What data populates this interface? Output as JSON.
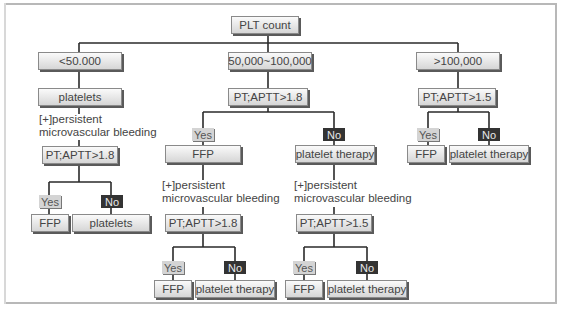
{
  "diagram": {
    "root": "PLT count",
    "branches": {
      "low": {
        "range": "<50.000",
        "action": "platelets",
        "note_line1": "[+]persistent",
        "note_line2": "microvascular bleeding",
        "test": "PT;APTT>1.8",
        "yes_label": "Yes",
        "no_label": "No",
        "yes_result": "FFP",
        "no_result": "platelets"
      },
      "mid": {
        "range": "50,000~100,000",
        "test": "PT;APTT>1.8",
        "yes_label": "Yes",
        "no_label": "No",
        "yes_branch": {
          "action": "FFP",
          "note_line1": "[+]persistent",
          "note_line2": "microvascular bleeding",
          "test": "PT;APTT>1.8",
          "yes_label": "Yes",
          "no_label": "No",
          "yes_result": "FFP",
          "no_result": "platelet therapy"
        },
        "no_branch": {
          "action": "platelet therapy",
          "note_line1": "[+]persistent",
          "note_line2": "microvascular bleeding",
          "test": "PT;APTT>1.5",
          "yes_label": "Yes",
          "no_label": "No",
          "yes_result": "FFP",
          "no_result": "platelet therapy"
        }
      },
      "high": {
        "range": ">100,000",
        "test": "PT;APTT>1.5",
        "yes_label": "Yes",
        "no_label": "No",
        "yes_result": "FFP",
        "no_result": "platelet therapy"
      }
    }
  }
}
